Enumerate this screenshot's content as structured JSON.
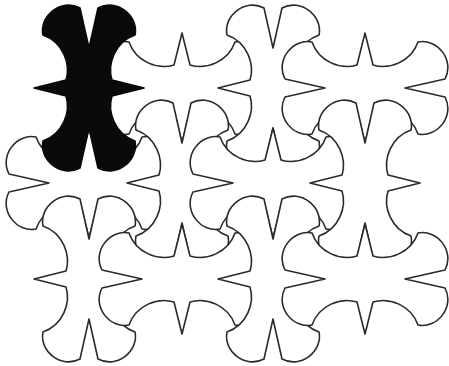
{
  "figure": {
    "background_color": "#ffffff",
    "outline_color": "#2a2a2a",
    "highlight_color": "#0a0a0a",
    "grid": {
      "columns": 4,
      "rows": 3,
      "origin_x": 89,
      "origin_y": 88,
      "spacing_x": 92,
      "spacing_y": 95.5
    },
    "tiles": [
      {
        "row": 0,
        "col": 0,
        "x": 89,
        "y": 88,
        "orientation": "A",
        "highlighted": true
      },
      {
        "row": 0,
        "col": 1,
        "x": 182,
        "y": 88,
        "orientation": "B",
        "highlighted": false
      },
      {
        "row": 0,
        "col": 2,
        "x": 273,
        "y": 88,
        "orientation": "A",
        "highlighted": false
      },
      {
        "row": 0,
        "col": 3,
        "x": 365,
        "y": 88,
        "orientation": "B",
        "highlighted": false
      },
      {
        "row": 1,
        "col": 0,
        "x": 89,
        "y": 183,
        "orientation": "B",
        "highlighted": false
      },
      {
        "row": 1,
        "col": 1,
        "x": 182,
        "y": 183,
        "orientation": "A",
        "highlighted": false
      },
      {
        "row": 1,
        "col": 2,
        "x": 273,
        "y": 183,
        "orientation": "B",
        "highlighted": false
      },
      {
        "row": 1,
        "col": 3,
        "x": 365,
        "y": 183,
        "orientation": "A",
        "highlighted": false
      },
      {
        "row": 2,
        "col": 0,
        "x": 89,
        "y": 279,
        "orientation": "A",
        "highlighted": false
      },
      {
        "row": 2,
        "col": 1,
        "x": 182,
        "y": 279,
        "orientation": "B",
        "highlighted": false
      },
      {
        "row": 2,
        "col": 2,
        "x": 273,
        "y": 279,
        "orientation": "A",
        "highlighted": false
      },
      {
        "row": 2,
        "col": 3,
        "x": 365,
        "y": 279,
        "orientation": "B",
        "highlighted": false
      }
    ],
    "tile_shape": {
      "name": "bowtie-star",
      "orientation_A": "spikes pointing left/right, notches at top/bottom",
      "orientation_B": "rotated 90 degrees: spikes pointing up/down, notches at left/right"
    }
  }
}
